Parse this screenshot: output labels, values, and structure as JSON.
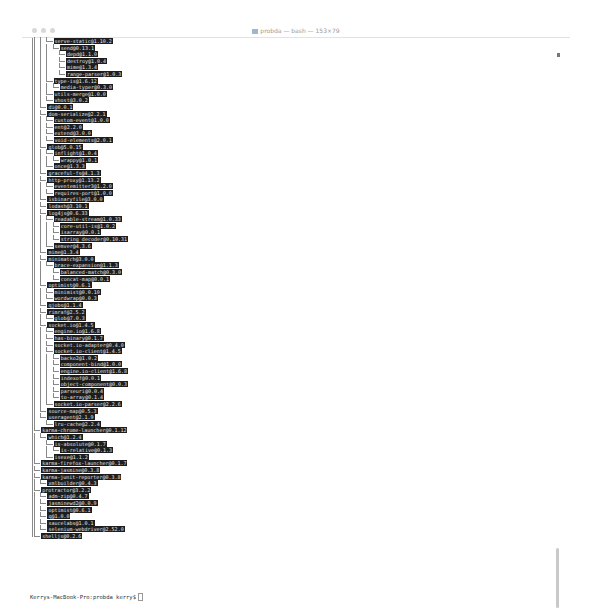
{
  "window": {
    "title": "probda — bash — 153×79",
    "prompt": "Kerrys-MacBook-Pro:probda kerry$"
  },
  "tree": [
    {
      "d": 3,
      "t": "serve-static@1.10.2"
    },
    {
      "d": 4,
      "t": "send@0.13.1"
    },
    {
      "d": 5,
      "t": "depd@1.1.0"
    },
    {
      "d": 5,
      "t": "destroy@1.0.4"
    },
    {
      "d": 5,
      "t": "mime@1.3.4"
    },
    {
      "d": 5,
      "t": "range-parser@1.0.3"
    },
    {
      "d": 3,
      "t": "type-is@1.6.12"
    },
    {
      "d": 4,
      "t": "media-typer@0.3.0"
    },
    {
      "d": 3,
      "t": "utils-merge@1.0.0"
    },
    {
      "d": 3,
      "t": "vhost@3.0.2"
    },
    {
      "d": 2,
      "t": "di@0.0.1"
    },
    {
      "d": 2,
      "t": "dom-serialize@2.2.1"
    },
    {
      "d": 3,
      "t": "custom-event@1.0.0"
    },
    {
      "d": 3,
      "t": "ent@2.2.0"
    },
    {
      "d": 3,
      "t": "extend@3.0.0"
    },
    {
      "d": 3,
      "t": "void-elements@2.0.1"
    },
    {
      "d": 2,
      "t": "glob@5.0.15"
    },
    {
      "d": 3,
      "t": "inflight@1.0.4"
    },
    {
      "d": 4,
      "t": "wrappy@1.0.1"
    },
    {
      "d": 3,
      "t": "once@1.3.3"
    },
    {
      "d": 2,
      "t": "graceful-fs@4.1.3"
    },
    {
      "d": 2,
      "t": "http-proxy@1.13.2"
    },
    {
      "d": 3,
      "t": "eventemitter3@1.2.0"
    },
    {
      "d": 3,
      "t": "requires-port@1.0.0"
    },
    {
      "d": 2,
      "t": "isbinaryfile@3.0.0"
    },
    {
      "d": 2,
      "t": "lodash@3.10.1"
    },
    {
      "d": 2,
      "t": "log4js@0.6.33"
    },
    {
      "d": 3,
      "t": "readable-stream@1.0.33"
    },
    {
      "d": 4,
      "t": "core-util-is@1.0.2"
    },
    {
      "d": 4,
      "t": "isarray@0.0.1"
    },
    {
      "d": 4,
      "t": "string_decoder@0.10.31"
    },
    {
      "d": 3,
      "t": "semver@4.3.6"
    },
    {
      "d": 2,
      "t": "mime@1.3.4"
    },
    {
      "d": 2,
      "t": "minimatch@3.0.0"
    },
    {
      "d": 3,
      "t": "brace-expansion@1.1.3"
    },
    {
      "d": 4,
      "t": "balanced-match@0.3.0"
    },
    {
      "d": 4,
      "t": "concat-map@0.0.1"
    },
    {
      "d": 2,
      "t": "optimist@0.6.1"
    },
    {
      "d": 3,
      "t": "minimist@0.0.10"
    },
    {
      "d": 3,
      "t": "wordwrap@0.0.3"
    },
    {
      "d": 2,
      "t": "qjobs@1.1.4"
    },
    {
      "d": 2,
      "t": "rimraf@2.5.2"
    },
    {
      "d": 3,
      "t": "glob@7.0.3"
    },
    {
      "d": 2,
      "t": "socket.io@1.4.5"
    },
    {
      "d": 3,
      "t": "engine.io@1.6.8"
    },
    {
      "d": 3,
      "t": "has-binary@0.1.7"
    },
    {
      "d": 3,
      "t": "socket.io-adapter@0.4.0"
    },
    {
      "d": 3,
      "t": "socket.io-client@1.4.5"
    },
    {
      "d": 4,
      "t": "backo2@1.0.2"
    },
    {
      "d": 4,
      "t": "component-bind@1.0.0"
    },
    {
      "d": 4,
      "t": "engine.io-client@1.6.8"
    },
    {
      "d": 4,
      "t": "indexof@0.0.1"
    },
    {
      "d": 4,
      "t": "object-component@0.0.3"
    },
    {
      "d": 4,
      "t": "parseuri@0.0.4"
    },
    {
      "d": 4,
      "t": "to-array@0.1.4"
    },
    {
      "d": 3,
      "t": "socket.io-parser@2.2.6"
    },
    {
      "d": 2,
      "t": "source-map@0.5.3"
    },
    {
      "d": 2,
      "t": "useragent@2.1.9"
    },
    {
      "d": 3,
      "t": "lru-cache@2.2.4"
    },
    {
      "d": 1,
      "t": "karma-chrome-launcher@0.1.12"
    },
    {
      "d": 2,
      "t": "which@1.2.4"
    },
    {
      "d": 3,
      "t": "is-absolute@0.1.7"
    },
    {
      "d": 4,
      "t": "is-relative@0.1.3"
    },
    {
      "d": 3,
      "t": "isexe@1.1.2"
    },
    {
      "d": 1,
      "t": "karma-firefox-launcher@0.1.7"
    },
    {
      "d": 1,
      "t": "karma-jasmine@0.3.8"
    },
    {
      "d": 1,
      "t": "karma-junit-reporter@0.3.8"
    },
    {
      "d": 2,
      "t": "xmlbuilder@0.4.3"
    },
    {
      "d": 1,
      "t": "protractor@3.2.2"
    },
    {
      "d": 2,
      "t": "adm-zip@0.4.7"
    },
    {
      "d": 2,
      "t": "jasminewd2@0.0.9"
    },
    {
      "d": 2,
      "t": "optimist@0.6.1"
    },
    {
      "d": 2,
      "t": "q@1.0.0"
    },
    {
      "d": 2,
      "t": "saucelabs@1.0.1"
    },
    {
      "d": 2,
      "t": "selenium-webdriver@2.52.0"
    },
    {
      "d": 1,
      "t": "shelljs@0.2.6"
    }
  ]
}
